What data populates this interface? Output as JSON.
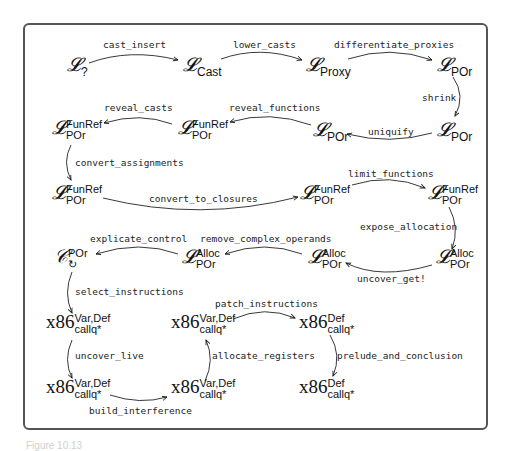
{
  "diagram": {
    "type": "compiler-pass-pipeline",
    "nodes": [
      {
        "id": "n1",
        "base": "𝓛",
        "sub": "?",
        "sup": ""
      },
      {
        "id": "n2",
        "base": "𝓛",
        "sub": "Cast",
        "sup": ""
      },
      {
        "id": "n3",
        "base": "𝓛",
        "sub": "Proxy",
        "sup": ""
      },
      {
        "id": "n4",
        "base": "𝓛",
        "sub": "POr",
        "sup": ""
      },
      {
        "id": "n5",
        "base": "𝓛",
        "sub": "POr",
        "sup": ""
      },
      {
        "id": "n6",
        "base": "𝓛",
        "sub": "POr",
        "sup": ""
      },
      {
        "id": "n7",
        "base": "𝓛",
        "sub": "POr",
        "sup": "FunRef"
      },
      {
        "id": "n8",
        "base": "𝓛",
        "sub": "POr",
        "sup": "FunRef"
      },
      {
        "id": "n9",
        "base": "𝓛",
        "sub": "POr",
        "sup": "FunRef"
      },
      {
        "id": "n10",
        "base": "𝓛",
        "sub": "POr",
        "sup": "FunRef"
      },
      {
        "id": "n11",
        "base": "𝓛",
        "sub": "POr",
        "sup": "FunRef"
      },
      {
        "id": "n12",
        "base": "𝓛",
        "sub": "POr",
        "sup": "Alloc"
      },
      {
        "id": "n13",
        "base": "𝓛",
        "sub": "POr",
        "sup": "Alloc"
      },
      {
        "id": "n14",
        "base": "𝓛",
        "sub": "POr",
        "sup": "Alloc"
      },
      {
        "id": "n15",
        "base": "𝒞",
        "sub": "↻",
        "sup": "POr"
      },
      {
        "id": "n16",
        "base": "x86",
        "sub": "callq*",
        "sup": "Var,Def"
      },
      {
        "id": "n17",
        "base": "x86",
        "sub": "callq*",
        "sup": "Var,Def"
      },
      {
        "id": "n18",
        "base": "x86",
        "sub": "callq*",
        "sup": "Var,Def"
      },
      {
        "id": "n19",
        "base": "x86",
        "sub": "callq*",
        "sup": "Var,Def"
      },
      {
        "id": "n20",
        "base": "x86",
        "sub": "callq*",
        "sup": "Def"
      },
      {
        "id": "n21",
        "base": "x86",
        "sub": "callq*",
        "sup": "Def"
      }
    ],
    "edges": [
      {
        "from": "n1",
        "to": "n2",
        "label": "cast_insert"
      },
      {
        "from": "n2",
        "to": "n3",
        "label": "lower_casts"
      },
      {
        "from": "n3",
        "to": "n4",
        "label": "differentiate_proxies"
      },
      {
        "from": "n4",
        "to": "n5",
        "label": "shrink"
      },
      {
        "from": "n5",
        "to": "n6",
        "label": "uniquify"
      },
      {
        "from": "n6",
        "to": "n8",
        "label": "reveal_functions"
      },
      {
        "from": "n8",
        "to": "n7",
        "label": "reveal_casts"
      },
      {
        "from": "n7",
        "to": "n9",
        "label": "convert_assignments"
      },
      {
        "from": "n9",
        "to": "n10",
        "label": "convert_to_closures"
      },
      {
        "from": "n10",
        "to": "n11",
        "label": "limit_functions"
      },
      {
        "from": "n11",
        "to": "n14",
        "label": "expose_allocation"
      },
      {
        "from": "n14",
        "to": "n13",
        "label": "uncover_get!"
      },
      {
        "from": "n13",
        "to": "n12",
        "label": "remove_complex_operands"
      },
      {
        "from": "n12",
        "to": "n15",
        "label": "explicate_control"
      },
      {
        "from": "n15",
        "to": "n16",
        "label": "select_instructions"
      },
      {
        "from": "n16",
        "to": "n18",
        "label": "uncover_live"
      },
      {
        "from": "n18",
        "to": "n19",
        "label": "build_interference"
      },
      {
        "from": "n19",
        "to": "n17",
        "label": "allocate_registers"
      },
      {
        "from": "n17",
        "to": "n20",
        "label": "patch_instructions"
      },
      {
        "from": "n20",
        "to": "n21",
        "label": "prelude_and_conclusion"
      }
    ]
  },
  "caption": "Figure 10.13"
}
